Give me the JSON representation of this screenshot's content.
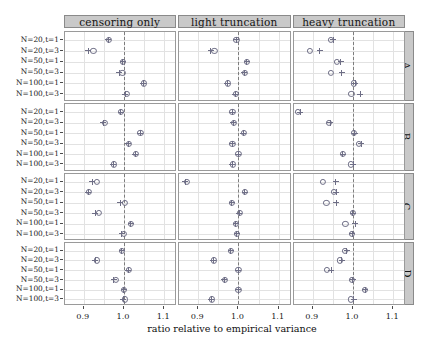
{
  "chart_data": {
    "type": "scatter",
    "title": "",
    "xlabel": "ratio relative to empirical variance",
    "ylabel": "",
    "xlim": [
      0.852,
      1.132
    ],
    "xticks": [
      0.9,
      1.0,
      1.1
    ],
    "xticklabels": [
      "0.9",
      "1.0",
      "1.1"
    ],
    "grid": true,
    "legend_position": "none",
    "reference_line": 1.0,
    "categories": [
      "N=20,t=1",
      "N=20,t=3",
      "N=50,t=1",
      "N=50,t=3",
      "N=100,t=1",
      "N=100,t=3"
    ],
    "column_facets": [
      "censoring only",
      "light truncation",
      "heavy truncation"
    ],
    "row_facets": [
      "A",
      "B",
      "C",
      "D"
    ],
    "series_names": [
      "circle",
      "plus"
    ],
    "panels": [
      {
        "row": "A",
        "col": "censoring only",
        "series": [
          {
            "name": "circle",
            "values": [
              0.963,
              0.924,
              0.998,
              0.996,
              1.049,
              1.008
            ]
          },
          {
            "name": "plus",
            "values": [
              0.961,
              0.911,
              0.997,
              0.988,
              1.048,
              1.003
            ]
          }
        ]
      },
      {
        "row": "A",
        "col": "light truncation",
        "series": [
          {
            "name": "circle",
            "values": [
              0.995,
              0.94,
              1.021,
              1.016,
              0.973,
              0.993
            ]
          },
          {
            "name": "plus",
            "values": [
              0.994,
              0.931,
              1.02,
              1.015,
              0.972,
              0.992
            ]
          }
        ]
      },
      {
        "row": "A",
        "col": "heavy truncation",
        "series": [
          {
            "name": "circle",
            "values": [
              0.945,
              0.892,
              0.96,
              0.945,
              1.003,
              0.996
            ]
          },
          {
            "name": "plus",
            "values": [
              0.951,
              0.917,
              0.97,
              0.972,
              1.006,
              1.018
            ]
          }
        ]
      },
      {
        "row": "B",
        "col": "censoring only",
        "series": [
          {
            "name": "circle",
            "values": [
              0.993,
              0.953,
              1.041,
              1.012,
              1.029,
              0.974
            ]
          },
          {
            "name": "plus",
            "values": [
              0.992,
              0.949,
              1.04,
              1.011,
              1.028,
              0.973
            ]
          }
        ]
      },
      {
        "row": "B",
        "col": "light truncation",
        "series": [
          {
            "name": "circle",
            "values": [
              0.985,
              0.988,
              1.013,
              0.985,
              1.0,
              0.986
            ]
          },
          {
            "name": "plus",
            "values": [
              0.984,
              0.987,
              1.012,
              0.984,
              0.999,
              0.985
            ]
          }
        ]
      },
      {
        "row": "B",
        "col": "heavy truncation",
        "series": [
          {
            "name": "circle",
            "values": [
              0.862,
              0.941,
              1.003,
              1.015,
              0.974,
              0.995
            ]
          },
          {
            "name": "plus",
            "values": [
              0.869,
              0.944,
              1.004,
              1.021,
              0.975,
              1.001
            ]
          }
        ]
      },
      {
        "row": "C",
        "col": "censoring only",
        "series": [
          {
            "name": "circle",
            "values": [
              0.932,
              0.912,
              1.002,
              0.938,
              1.018,
              0.999
            ]
          },
          {
            "name": "plus",
            "values": [
              0.921,
              0.911,
              0.991,
              0.928,
              1.017,
              0.994
            ]
          }
        ]
      },
      {
        "row": "C",
        "col": "light truncation",
        "series": [
          {
            "name": "circle",
            "values": [
              0.872,
              1.017,
              0.984,
              1.003,
              0.994,
              0.997
            ]
          },
          {
            "name": "plus",
            "values": [
              0.868,
              1.016,
              0.983,
              1.002,
              0.993,
              0.996
            ]
          }
        ]
      },
      {
        "row": "C",
        "col": "heavy truncation",
        "series": [
          {
            "name": "circle",
            "values": [
              0.926,
              0.953,
              0.934,
              0.999,
              0.981,
              0.997
            ]
          },
          {
            "name": "plus",
            "values": [
              0.957,
              0.958,
              0.958,
              1.0,
              1.006,
              0.998
            ]
          }
        ]
      },
      {
        "row": "D",
        "col": "censoring only",
        "series": [
          {
            "name": "circle",
            "values": [
              0.995,
              0.933,
              1.012,
              0.979,
              1.0,
              1.003
            ]
          },
          {
            "name": "plus",
            "values": [
              0.994,
              0.928,
              1.011,
              0.974,
              0.999,
              0.998
            ]
          }
        ]
      },
      {
        "row": "D",
        "col": "light truncation",
        "series": [
          {
            "name": "circle",
            "values": [
              0.982,
              0.938,
              1.0,
              0.966,
              1.0,
              0.933
            ]
          },
          {
            "name": "plus",
            "values": [
              0.981,
              0.937,
              0.999,
              0.965,
              0.999,
              0.932
            ]
          }
        ]
      },
      {
        "row": "D",
        "col": "heavy truncation",
        "series": [
          {
            "name": "circle",
            "values": [
              0.979,
              0.968,
              0.936,
              0.998,
              1.03,
              0.995
            ]
          },
          {
            "name": "plus",
            "values": [
              0.984,
              0.972,
              0.946,
              1.0,
              1.031,
              1.002
            ]
          }
        ]
      }
    ]
  },
  "axis": {
    "xlabel": "ratio relative to empirical variance",
    "xticklabels": [
      "0.9",
      "1.0",
      "1.1"
    ]
  },
  "colors": {
    "strip_fill": "#c9c9c9",
    "strip_border": "#8a8a8a",
    "panel_border": "#9a9a9a",
    "grid": "#e2e2e2",
    "marker": "#6e6e86",
    "refline": "#7d7d7d"
  }
}
